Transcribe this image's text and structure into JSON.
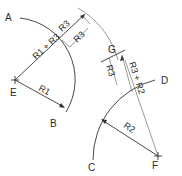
{
  "diagram": {
    "points": {
      "A": "A",
      "B": "B",
      "C": "C",
      "D": "D",
      "E": "E",
      "F": "F",
      "G": "G"
    },
    "dimensions": {
      "r1_plus_r3": "R1 + R3",
      "r1": "R1",
      "r3_a": "R3",
      "r3_b": "R3",
      "r3_c": "R3",
      "r3_plus_r2": "R3 + R2",
      "r2": "R2"
    },
    "colors": {
      "line": "#333333",
      "background": "#ffffff"
    }
  }
}
